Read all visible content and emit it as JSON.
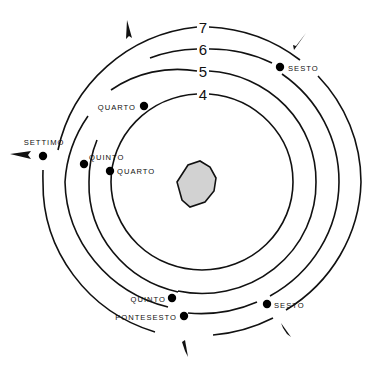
{
  "diagram": {
    "center": {
      "x": 202,
      "y": 182
    },
    "core_polygon": "177,182 188,165 200,161 210,167 216,178 214,191 205,202 190,207 182,200",
    "colors": {
      "line": "#111111",
      "dot": "#000000",
      "core_fill": "#d2d2d2",
      "background": "#ffffff"
    },
    "rings": [
      {
        "number": "4",
        "label_x": 203,
        "label_y": 94,
        "path": "M 197 94 A 91 88 0 0 0 111 182 M 209 94 A 91 88 0 0 1 293 182 A 91 88 0 0 1 202 270 A 91 88 0 0 1 111 182"
      },
      {
        "number": "5",
        "label_x": 203,
        "label_y": 71,
        "path": "M 197 71 A 114 110 0 0 0 111 90 M 209 71 A 114 110 0 0 1 316 182 A 114 110 0 0 1 178 291 M 178 292 A 114 110 0 0 1 89 182 A 114 110 0 0 1 97 140"
      },
      {
        "number": "6",
        "label_x": 203,
        "label_y": 49,
        "path": "M 197 49 A 137 132 0 0 0 150 58 M 209 49 A 137 132 0 0 1 272 63 M 282 74 A 137 132 0 0 1 339 182 A 137 132 0 0 1 270 296 M 257 302 A 137 132 0 0 1 188 313 M 168 307 A 137 132 0 0 1 65 182 A 137 132 0 0 1 88 116"
      },
      {
        "number": "7",
        "label_x": 203,
        "label_y": 27,
        "path": "M 197 27 A 159 155 0 0 0 58 150 M 209 27 A 159 155 0 0 1 300 60 M 318 76 A 159 155 0 0 1 361 182 A 159 155 0 0 1 286 310 M 273 318 A 159 155 0 0 1 213 335 M 155 332 A 159 155 0 0 1 43 182 A 159 155 0 0 1 43 170"
      }
    ],
    "stops": [
      {
        "label": "SESTO",
        "dot_x": 280,
        "dot_y": 67,
        "label_x": 288,
        "label_y": 68,
        "anchor": "start"
      },
      {
        "label": "QUARTO",
        "dot_x": 144,
        "dot_y": 106,
        "label_x": 136,
        "label_y": 107,
        "anchor": "end"
      },
      {
        "label": "SETTIMO",
        "dot_x": 43,
        "dot_y": 156,
        "label_x": 44,
        "label_y": 142,
        "anchor": "middle"
      },
      {
        "label": "QUINTO",
        "dot_x": 84,
        "dot_y": 164,
        "label_x": 89,
        "label_y": 157,
        "anchor": "start"
      },
      {
        "label": "QUARTO",
        "dot_x": 110,
        "dot_y": 171,
        "label_x": 117,
        "label_y": 171,
        "anchor": "start"
      },
      {
        "label": "QUINTO",
        "dot_x": 172,
        "dot_y": 298,
        "label_x": 166,
        "label_y": 299,
        "anchor": "end"
      },
      {
        "label": "PONTESESTO",
        "dot_x": 184,
        "dot_y": 316,
        "label_x": 177,
        "label_y": 317,
        "anchor": "end"
      },
      {
        "label": "SESTO",
        "dot_x": 267,
        "dot_y": 304,
        "label_x": 274,
        "label_y": 305,
        "anchor": "start"
      }
    ],
    "arrows": [
      {
        "name": "arrow-north-west",
        "points": "127,20 132,38 129,36 126,39"
      },
      {
        "name": "arrow-north-east",
        "points": "306,33 296,46 293,45 294,50"
      },
      {
        "name": "arrow-west",
        "points": "10,154 31,151 28,155 31,159"
      },
      {
        "name": "arrow-south",
        "points": "185,340 188,357 185,351 182,342"
      },
      {
        "name": "arrow-south-east",
        "points": "281,323 291,337 287,334 283,328"
      }
    ]
  }
}
